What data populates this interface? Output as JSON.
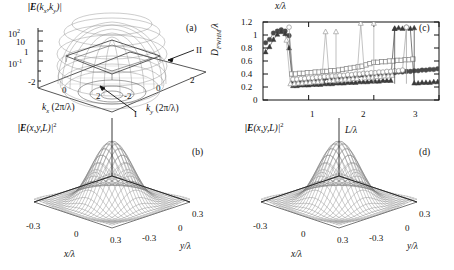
{
  "figure": {
    "caption_panels": [
      "(a)",
      "(b)",
      "(c)",
      "(d)"
    ],
    "background": "#ffffff",
    "ink": "#111111",
    "mesh_color": "#7a7a7a"
  },
  "panel_a": {
    "label": "(a)",
    "title": "|E(k",
    "title_sub1": "x",
    "title_mid": ",k",
    "title_sub2": "y",
    "title_end": ")|",
    "zaxis_ticks": [
      "10",
      "10",
      "1",
      "10"
    ],
    "zaxis_tick_sups": [
      "2",
      "",
      "",
      "-1"
    ],
    "zaxis_tick_labels": [
      "10^2",
      "10",
      "1",
      "10^-1"
    ],
    "xaxis_name": "k",
    "xaxis_name_sub": "x",
    "xaxis_name_unit": "(2π/λ)",
    "xaxis_ticks": [
      "-2",
      "0",
      "2"
    ],
    "yaxis_name": "k",
    "yaxis_name_sub": "y",
    "yaxis_name_unit": "(2π/λ)",
    "yaxis_ticks": [
      "-2",
      "0",
      "2"
    ],
    "annotations": [
      {
        "text": "II",
        "role": "upper-right-feature"
      },
      {
        "text": "I",
        "role": "lower-center-feature"
      }
    ],
    "surface_description": "log-scale plateau / truncated-dome angular spectrum"
  },
  "panel_b": {
    "label": "(b)",
    "title": "|E(x,y,L)|",
    "title_sup": "2",
    "xaxis_name": "x/λ",
    "xaxis_ticks": [
      "-0.3",
      "0",
      "0.3"
    ],
    "yaxis_name": "y/λ",
    "yaxis_ticks": [
      "-0.3",
      "0",
      "0.3"
    ],
    "surface_description": "sharp central peak with concentric side-lobe rings"
  },
  "panel_d": {
    "label": "(d)",
    "title": "|E(x,y,L)|",
    "title_sup": "2",
    "xaxis_name": "x/λ",
    "xaxis_ticks": [
      "-0.3",
      "0",
      "0.3"
    ],
    "yaxis_name": "y/λ",
    "yaxis_ticks": [
      "-0.3",
      "0",
      "0.3"
    ],
    "surface_description": "sharp central peak with concentric side-lobe rings"
  },
  "chart_data": {
    "type": "line",
    "title": "",
    "panel_label": "(c)",
    "top_label": "x/λ",
    "xlabel": "L/λ",
    "ylabel_main": "D",
    "ylabel_sub": "FWHM",
    "ylabel_tail": "/λ",
    "ylabel": "D_FWHM/λ",
    "xlim": [
      0.3,
      3.0
    ],
    "ylim": [
      0,
      1.2
    ],
    "xticks": [
      1,
      2,
      3
    ],
    "xtick_labels": [
      "1",
      "2",
      "3"
    ],
    "yticks": [
      0,
      0.2,
      0.4,
      0.6,
      0.8,
      1.0,
      1.2
    ],
    "ytick_labels": [
      "0",
      "0.2",
      "0.4",
      "0.6",
      "0.8",
      "1",
      "1.2"
    ],
    "grid": false,
    "legend": "none",
    "series": [
      {
        "name": "filled-circle",
        "marker": "filled-circle",
        "color": "#4a4a4a",
        "x": [
          0.34,
          0.4,
          0.46,
          0.52,
          0.58,
          0.64,
          0.7,
          0.76,
          0.82,
          0.88,
          0.94,
          1.0,
          1.06,
          1.12,
          1.18,
          1.24,
          1.3,
          1.36,
          1.42,
          1.48,
          1.54,
          1.6,
          1.66,
          1.72,
          1.78,
          1.84,
          1.9,
          1.96,
          2.02,
          2.08,
          2.14,
          2.2,
          2.26,
          2.32,
          2.38,
          2.44,
          2.5,
          2.56,
          2.62,
          2.68,
          2.74,
          2.8,
          2.86,
          2.92,
          2.98
        ],
        "y": [
          0.88,
          0.93,
          1.03,
          1.06,
          1.08,
          1.06,
          0.99,
          0.29,
          0.3,
          0.3,
          0.31,
          0.31,
          0.32,
          0.32,
          0.33,
          0.33,
          0.34,
          0.34,
          0.35,
          0.35,
          0.36,
          0.36,
          0.37,
          0.37,
          0.38,
          0.38,
          0.39,
          0.39,
          0.4,
          0.4,
          0.41,
          0.41,
          0.42,
          0.42,
          0.43,
          0.43,
          0.44,
          0.44,
          0.45,
          0.45,
          0.46,
          0.46,
          0.47,
          0.47,
          0.48
        ]
      },
      {
        "name": "filled-triangle",
        "marker": "filled-triangle",
        "color": "#3a3a3a",
        "x": [
          0.34,
          0.4,
          0.46,
          0.52,
          0.58,
          0.64,
          0.7,
          0.76,
          0.82,
          0.88,
          0.94,
          1.0,
          1.06,
          1.12,
          1.18,
          1.24,
          1.3,
          1.36,
          1.42,
          1.48,
          1.54,
          1.6,
          1.66,
          1.72,
          1.78,
          1.84,
          1.9,
          1.96,
          2.02,
          2.08,
          2.14,
          2.2,
          2.26,
          2.32,
          2.38,
          2.44,
          2.5,
          2.56,
          2.62,
          2.68,
          2.74,
          2.8,
          2.86,
          2.92,
          2.98
        ],
        "y": [
          0.74,
          0.82,
          0.93,
          1.01,
          1.05,
          1.02,
          0.8,
          0.22,
          0.22,
          0.23,
          0.23,
          0.23,
          0.24,
          0.24,
          0.24,
          0.25,
          0.25,
          0.25,
          0.26,
          0.26,
          0.26,
          0.27,
          0.27,
          0.27,
          0.28,
          0.28,
          0.28,
          0.29,
          0.29,
          0.29,
          0.3,
          0.3,
          0.3,
          1.1,
          1.11,
          1.1,
          1.11,
          1.1,
          0.26,
          0.26,
          0.27,
          0.27,
          0.27,
          0.28,
          0.28
        ]
      },
      {
        "name": "open-square",
        "marker": "open-square",
        "color": "#8a8a8a",
        "x": [
          0.74,
          0.8,
          0.86,
          0.92,
          0.98,
          1.04,
          1.1,
          1.16,
          1.22,
          1.28,
          1.34,
          1.4,
          1.46,
          1.52,
          1.58,
          1.64,
          1.7,
          1.76,
          1.82,
          1.88,
          1.94,
          2.0,
          2.06,
          2.12,
          2.18,
          2.24,
          2.3,
          2.36,
          2.42,
          2.48,
          2.54,
          2.6
        ],
        "y": [
          0.4,
          0.4,
          0.41,
          0.41,
          0.42,
          0.42,
          0.43,
          0.43,
          0.44,
          0.44,
          0.45,
          0.45,
          0.46,
          0.47,
          0.48,
          0.49,
          0.5,
          0.51,
          0.52,
          0.54,
          0.56,
          0.58,
          0.58,
          0.59,
          0.59,
          0.6,
          0.6,
          0.61,
          0.61,
          0.62,
          0.62,
          0.63
        ]
      },
      {
        "name": "open-circle",
        "marker": "open-circle",
        "color": "#9a9a9a",
        "x": [
          0.7,
          0.76,
          0.82,
          0.88,
          0.94,
          1.0,
          1.06,
          1.12,
          1.18,
          1.24,
          1.3,
          1.36,
          1.42,
          1.48,
          1.54,
          1.6,
          1.66,
          1.72,
          1.78,
          1.84,
          1.9,
          1.96,
          2.02,
          2.08,
          2.14,
          2.2,
          2.26,
          2.32,
          2.38,
          2.44,
          2.5
        ],
        "y": [
          1.12,
          0.32,
          0.32,
          0.33,
          0.33,
          0.34,
          0.34,
          0.35,
          0.35,
          0.36,
          0.36,
          0.37,
          0.37,
          0.38,
          0.38,
          0.39,
          0.39,
          0.4,
          0.4,
          0.41,
          0.41,
          0.42,
          0.42,
          0.43,
          0.43,
          0.44,
          0.44,
          0.45,
          0.45,
          0.46,
          1.12
        ]
      },
      {
        "name": "open-triangle",
        "marker": "open-triangle",
        "color": "#a5a5a5",
        "x": [
          0.66,
          0.72,
          0.78,
          0.84,
          0.9,
          0.96,
          1.02,
          1.08,
          1.14,
          1.2,
          1.26,
          1.32,
          1.38,
          1.44,
          1.5,
          1.56,
          1.62,
          1.68,
          1.74,
          1.8,
          1.86,
          1.92,
          1.98,
          2.04,
          2.1,
          2.16,
          2.22,
          2.28
        ],
        "y": [
          0.92,
          0.25,
          0.25,
          0.26,
          0.26,
          0.27,
          0.27,
          0.28,
          0.28,
          0.29,
          1.05,
          0.3,
          0.3,
          0.31,
          0.31,
          0.32,
          0.32,
          0.33,
          0.33,
          1.18,
          0.34,
          0.35,
          0.35,
          0.36,
          0.36,
          0.37,
          0.37,
          0.38
        ]
      }
    ],
    "spikes": [
      {
        "x": 1.42,
        "series": "open-triangle",
        "y_top": 1.05
      },
      {
        "x": 2.0,
        "series": "open-triangle",
        "y_top": 1.18
      },
      {
        "x": 2.32,
        "series": "filled-triangle",
        "y_top": 1.1
      },
      {
        "x": 2.5,
        "series": "open-circle",
        "y_top": 1.12
      },
      {
        "x": 2.62,
        "series": "filled-triangle",
        "y_top": 1.11
      }
    ]
  }
}
